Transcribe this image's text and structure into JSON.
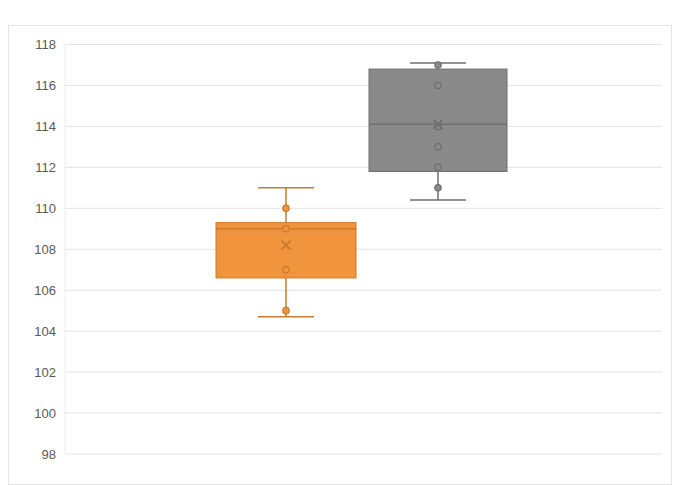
{
  "chart_data": {
    "type": "boxplot",
    "title": "",
    "xlabel": "",
    "ylabel": "",
    "ylim": [
      98,
      118
    ],
    "y_ticks": [
      98,
      100,
      102,
      104,
      106,
      108,
      110,
      112,
      114,
      116,
      118
    ],
    "grid": true,
    "legend": null,
    "series": [
      {
        "name": "Series 1",
        "color": "#F0943E",
        "stroke": "#C87A2E",
        "min": 104.7,
        "q1": 106.6,
        "median": 109.0,
        "q3": 109.3,
        "max": 111.0,
        "mean": 108.2,
        "points": [
          105,
          107,
          109,
          110
        ]
      },
      {
        "name": "Series 2",
        "color": "#8A8A8A",
        "stroke": "#6E6E6E",
        "min": 110.4,
        "q1": 111.8,
        "median": 114.1,
        "q3": 116.8,
        "max": 117.1,
        "mean": 114.1,
        "points": [
          111,
          112,
          113,
          114,
          116,
          117
        ]
      }
    ]
  }
}
